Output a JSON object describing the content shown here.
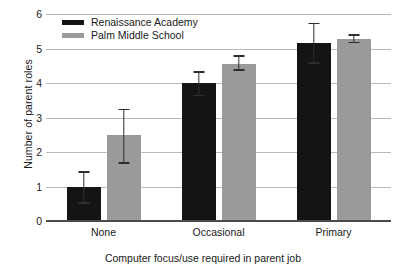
{
  "chart_data": {
    "type": "bar",
    "title": "",
    "xlabel": "Computer focus/use required in parent job",
    "ylabel": "Number of parent roles",
    "categories": [
      "None",
      "Occasional",
      "Primary"
    ],
    "ylim": [
      0,
      6
    ],
    "yticks": [
      0,
      1,
      2,
      3,
      4,
      5,
      6
    ],
    "grid": true,
    "legend_position": "top-left inside plot",
    "series": [
      {
        "name": "Renaissance Academy",
        "color": "#141414",
        "values": [
          1.0,
          4.0,
          5.15
        ],
        "error_low": [
          0.5,
          3.62,
          4.55
        ],
        "error_high": [
          1.45,
          4.35,
          5.75
        ]
      },
      {
        "name": "Palm Middle School",
        "color": "#9a9a9a",
        "values": [
          2.5,
          4.55,
          5.27
        ],
        "error_low": [
          1.65,
          4.35,
          5.15
        ],
        "error_high": [
          3.25,
          4.8,
          5.42
        ]
      }
    ]
  }
}
